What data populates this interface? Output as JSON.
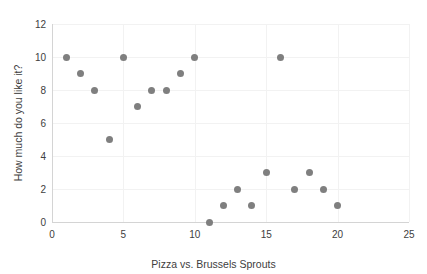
{
  "chart_data": {
    "type": "scatter",
    "title": "",
    "xlabel": "Pizza vs. Brussels Sprouts",
    "ylabel": "How much do you like it?",
    "xlim": [
      0,
      25
    ],
    "ylim": [
      0,
      12
    ],
    "xticks": [
      "0",
      "5",
      "10",
      "15",
      "20",
      "25"
    ],
    "xtick_values": [
      0,
      5,
      10,
      15,
      20,
      25
    ],
    "yticks": [
      "0",
      "2",
      "4",
      "6",
      "8",
      "10",
      "12"
    ],
    "ytick_values": [
      0,
      2,
      4,
      6,
      8,
      10,
      12
    ],
    "grid": true,
    "legend": false,
    "marker_color": "#7f7f7f",
    "gridline_color": "#f2f2f2",
    "axis_color": "#d4d4d4",
    "series": [
      {
        "name": "responses",
        "x": [
          1,
          2,
          3,
          4,
          5,
          6,
          7,
          8,
          9,
          10,
          11,
          12,
          13,
          14,
          15,
          16,
          17,
          18,
          19,
          20
        ],
        "y": [
          10,
          9,
          8,
          5,
          10,
          7,
          8,
          8,
          9,
          10,
          0,
          1,
          2,
          1,
          3,
          10,
          2,
          3,
          2,
          1
        ],
        "points": [
          [
            1,
            10
          ],
          [
            2,
            9
          ],
          [
            3,
            8
          ],
          [
            4,
            5
          ],
          [
            5,
            10
          ],
          [
            6,
            7
          ],
          [
            7,
            8
          ],
          [
            8,
            8
          ],
          [
            9,
            9
          ],
          [
            10,
            10
          ],
          [
            11,
            0
          ],
          [
            12,
            1
          ],
          [
            13,
            2
          ],
          [
            14,
            1
          ],
          [
            15,
            3
          ],
          [
            16,
            10
          ],
          [
            17,
            2
          ],
          [
            18,
            3
          ],
          [
            19,
            2
          ],
          [
            20,
            1
          ]
        ]
      }
    ]
  }
}
